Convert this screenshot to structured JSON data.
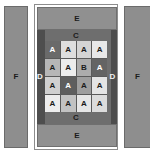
{
  "figure": {
    "background": "#ffffff",
    "panel_fill": "#8e8e8e",
    "body_fill": "#4e4e4e",
    "frame_fill": "#6e6e6e",
    "grid_line": "#5a5a5a"
  },
  "left_panel": {
    "label": "F"
  },
  "right_panel": {
    "label": "F"
  },
  "middle_panel": {
    "top_bar_label": "E",
    "bottom_bar_label": "E",
    "band_top_label": "C",
    "band_bottom_label": "C",
    "side_left_label": "D",
    "side_right_label": "D"
  },
  "grid": {
    "rows": 4,
    "cols": 4,
    "cells": [
      [
        {
          "label": "A",
          "fill": "#6a6a6a",
          "text": "#ffffff"
        },
        {
          "label": "A",
          "fill": "#dedede",
          "text": "#1b1b1b"
        },
        {
          "label": "A",
          "fill": "#d4d4d4",
          "text": "#1b1b1b"
        },
        {
          "label": "A",
          "fill": "#e8e8e8",
          "text": "#1b1b1b"
        }
      ],
      [
        {
          "label": "A",
          "fill": "#b6b6b6",
          "text": "#1b1b1b"
        },
        {
          "label": "A",
          "fill": "#ececec",
          "text": "#1b1b1b"
        },
        {
          "label": "B",
          "fill": "#acacac",
          "text": "#1b1b1b"
        },
        {
          "label": "A",
          "fill": "#646464",
          "text": "#ffffff"
        }
      ],
      [
        {
          "label": "A",
          "fill": "#d0d0d0",
          "text": "#1b1b1b"
        },
        {
          "label": "A",
          "fill": "#5e5e5e",
          "text": "#ffffff"
        },
        {
          "label": "A",
          "fill": "#9e9e9e",
          "text": "#1b1b1b"
        },
        {
          "label": "A",
          "fill": "#e4e4e4",
          "text": "#1b1b1b"
        }
      ],
      [
        {
          "label": "A",
          "fill": "#ededed",
          "text": "#1b1b1b"
        },
        {
          "label": "A",
          "fill": "#c2c2c2",
          "text": "#1b1b1b"
        },
        {
          "label": "A",
          "fill": "#e6e6e6",
          "text": "#1b1b1b"
        },
        {
          "label": "A",
          "fill": "#dcdcdc",
          "text": "#1b1b1b"
        }
      ]
    ]
  }
}
